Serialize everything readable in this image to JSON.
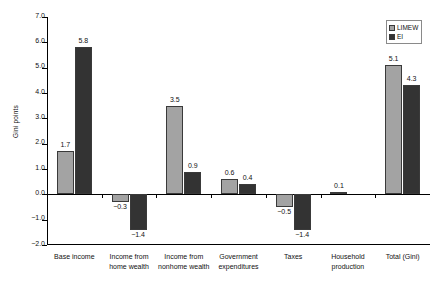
{
  "chart_data": {
    "type": "bar",
    "title": "",
    "xlabel": "",
    "ylabel": "Gini points",
    "ylim": [
      -2.0,
      7.0
    ],
    "ytick_labels": [
      "7.0",
      "6.0",
      "5.0",
      "4.0",
      "3.0",
      "2.0",
      "1.0",
      "0.0",
      "-1.0",
      "-2.0"
    ],
    "ytick_values": [
      7.0,
      6.0,
      5.0,
      4.0,
      3.0,
      2.0,
      1.0,
      0.0,
      -1.0,
      -2.0
    ],
    "grid": false,
    "legend_position": "top-right",
    "categories": [
      "Base income",
      "Income from home wealth",
      "Income from nonhome wealth",
      "Government expenditures",
      "Taxes",
      "Household production",
      "Total (Gini)"
    ],
    "category_lines": [
      [
        "Base income"
      ],
      [
        "Income from",
        "home wealth"
      ],
      [
        "Income from",
        "nonhome wealth"
      ],
      [
        "Government",
        "expenditures"
      ],
      [
        "Taxes"
      ],
      [
        "Household",
        "production"
      ],
      [
        "Total (Gini)"
      ]
    ],
    "series": [
      {
        "name": "LIMEW",
        "color": "#a3a3a3",
        "values": [
          1.7,
          -0.3,
          3.5,
          0.6,
          -0.5,
          0.1,
          5.1
        ],
        "labels": [
          "1.7",
          "−0.3",
          "3.5",
          "0.6",
          "−0.5",
          "0.1",
          "5.1"
        ]
      },
      {
        "name": "EI",
        "color": "#333333",
        "values": [
          5.8,
          -1.4,
          0.9,
          0.4,
          -1.4,
          0.0,
          4.3
        ],
        "labels": [
          "5.8",
          "−1.4",
          "0.9",
          "0.4",
          "−1.4",
          "",
          "4.3"
        ]
      }
    ]
  },
  "legend": {
    "items": [
      {
        "label": "LIMEW"
      },
      {
        "label": "EI"
      }
    ]
  }
}
